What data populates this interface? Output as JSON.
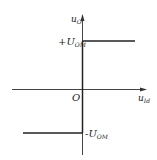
{
  "diagram": {
    "type": "transfer-characteristic",
    "y_axis": {
      "label_main": "u",
      "label_sub": "O"
    },
    "x_axis": {
      "label_main": "u",
      "label_sub": "Id"
    },
    "origin_label": "O",
    "upper_level": {
      "sign": "+",
      "main": "U",
      "sub": "OM"
    },
    "lower_level": {
      "sign": "-",
      "main": "U",
      "sub": "OM"
    },
    "colors": {
      "line": "#222222",
      "background": "#ffffff"
    }
  }
}
